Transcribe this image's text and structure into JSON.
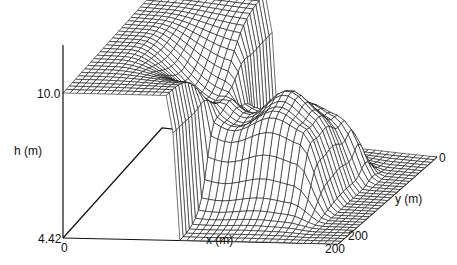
{
  "chart_data": {
    "type": "surface3d",
    "title": "",
    "axes": {
      "h": {
        "label": "h (m)",
        "ticks": [
          "4.42",
          "10.0"
        ],
        "range": [
          4.42,
          10.0
        ]
      },
      "x": {
        "label": "x (m)",
        "ticks": [
          "0",
          "200"
        ],
        "range": [
          0,
          200
        ]
      },
      "y": {
        "label": "y (m)",
        "ticks": [
          "0",
          "200"
        ],
        "range": [
          0,
          200
        ]
      }
    },
    "surface": {
      "grid_nx": 40,
      "grid_ny": 32,
      "upstream_level": 10.0,
      "downstream_level": 4.42,
      "dam_x": 80,
      "breach_y": [
        70,
        130
      ],
      "wave_front_x": 150
    },
    "grid": false,
    "legend": null
  },
  "labels": {
    "h_top": "10.0",
    "h_bottom": "4.42",
    "h_axis": "h (m)",
    "x_origin": "0",
    "x_end": "200",
    "x_axis": "x (m)",
    "y_origin": "0",
    "y_end": "200",
    "y_axis": "y (m)"
  },
  "colors": {
    "line": "#111111",
    "background": "#ffffff"
  }
}
